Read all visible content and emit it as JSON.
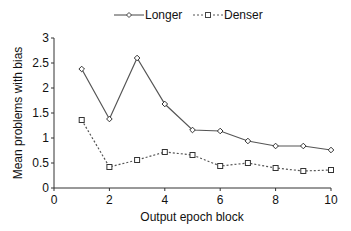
{
  "chart_data": {
    "type": "line",
    "title": "",
    "xlabel": "Output epoch block",
    "ylabel": "Mean problems with bias",
    "xlim": [
      0,
      10
    ],
    "ylim": [
      0,
      3
    ],
    "x_ticks": [
      "0",
      "2",
      "4",
      "6",
      "8",
      "10"
    ],
    "y_ticks": [
      "0",
      "0.5",
      "1",
      "1.5",
      "2",
      "2.5",
      "3"
    ],
    "grid": false,
    "legend_position": "top",
    "x": [
      1,
      2,
      3,
      4,
      5,
      6,
      7,
      8,
      9,
      10
    ],
    "series": [
      {
        "name": "Longer",
        "style": "solid",
        "marker": "diamond",
        "values": [
          2.38,
          1.38,
          2.6,
          1.68,
          1.16,
          1.14,
          0.94,
          0.84,
          0.84,
          0.76
        ]
      },
      {
        "name": "Denser",
        "style": "dotted",
        "marker": "square",
        "values": [
          1.36,
          0.42,
          0.56,
          0.72,
          0.66,
          0.44,
          0.5,
          0.4,
          0.34,
          0.36
        ]
      }
    ]
  },
  "legend": {
    "items": [
      {
        "label": "Longer"
      },
      {
        "label": "Denser"
      }
    ]
  },
  "colors": {
    "line": "#555555",
    "axis": "#333333"
  }
}
